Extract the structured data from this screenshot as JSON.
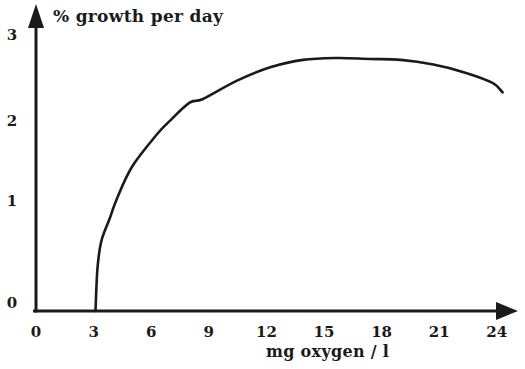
{
  "figure": {
    "background": "#ffffff",
    "ink_color": "#1a1a1a"
  },
  "chart_data": {
    "type": "line",
    "title": "% growth per day",
    "xlabel": "mg oxygen / l",
    "ylabel": "% growth per day",
    "x_ticks": [
      "0",
      "3",
      "6",
      "9",
      "12",
      "15",
      "18",
      "21",
      "24"
    ],
    "x_tick_values": [
      0,
      3,
      6,
      9,
      12,
      15,
      18,
      21,
      24
    ],
    "y_ticks": [
      "0",
      "1",
      "2",
      "3"
    ],
    "y_tick_values": [
      0,
      1,
      2,
      3
    ],
    "xlim": [
      0,
      25.2
    ],
    "ylim": [
      0,
      3.3
    ],
    "grid": false,
    "legend": false,
    "line_color": "#1a1a1a",
    "series": [
      {
        "name": "growth-vs-oxygen",
        "points": [
          [
            3.1,
            0.0
          ],
          [
            3.2,
            0.45
          ],
          [
            3.4,
            0.75
          ],
          [
            3.85,
            1.0
          ],
          [
            4.2,
            1.2
          ],
          [
            5.0,
            1.55
          ],
          [
            6.3,
            1.9
          ],
          [
            7.0,
            2.05
          ],
          [
            8.0,
            2.24
          ],
          [
            8.7,
            2.28
          ],
          [
            10.5,
            2.48
          ],
          [
            12.2,
            2.62
          ],
          [
            13.9,
            2.7
          ],
          [
            15.7,
            2.72
          ],
          [
            17.4,
            2.71
          ],
          [
            19.0,
            2.7
          ],
          [
            20.7,
            2.65
          ],
          [
            22.4,
            2.56
          ],
          [
            23.8,
            2.45
          ],
          [
            24.3,
            2.35
          ]
        ]
      }
    ]
  }
}
